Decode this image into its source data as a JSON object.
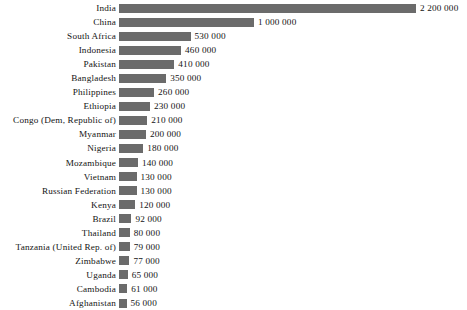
{
  "chart_data": {
    "type": "bar",
    "orientation": "horizontal",
    "title": "",
    "subtitle": "",
    "xlabel": "",
    "ylabel": "",
    "grid": false,
    "legend": null,
    "axis_visible": false,
    "tick_labels": [],
    "xlim": [
      0,
      2200000
    ],
    "value_label_format": "space-separated thousands",
    "bar_color": "#6b6b6b",
    "text_color": "#141414",
    "background": "#ffffff",
    "categories": [
      "India",
      "China",
      "South Africa",
      "Indonesia",
      "Pakistan",
      "Bangladesh",
      "Philippines",
      "Ethiopia",
      "Congo (Dem, Republic of)",
      "Myanmar",
      "Nigeria",
      "Mozambique",
      "Vietnam",
      "Russian Federation",
      "Kenya",
      "Brazil",
      "Thailand",
      "Tanzania (United Rep. of)",
      "Zimbabwe",
      "Uganda",
      "Cambodia",
      "Afghanistan"
    ],
    "values": [
      2200000,
      1000000,
      530000,
      460000,
      410000,
      350000,
      260000,
      230000,
      210000,
      200000,
      180000,
      140000,
      130000,
      130000,
      120000,
      92000,
      80000,
      79000,
      77000,
      65000,
      61000,
      56000
    ],
    "value_labels": [
      "2 200 000",
      "1 000 000",
      "530 000",
      "460 000",
      "410 000",
      "350 000",
      "260 000",
      "230 000",
      "210 000",
      "200 000",
      "180 000",
      "140 000",
      "130 000",
      "130 000",
      "120 000",
      "92 000",
      "80 000",
      "79 000",
      "77 000",
      "65 000",
      "61 000",
      "56 000"
    ]
  }
}
